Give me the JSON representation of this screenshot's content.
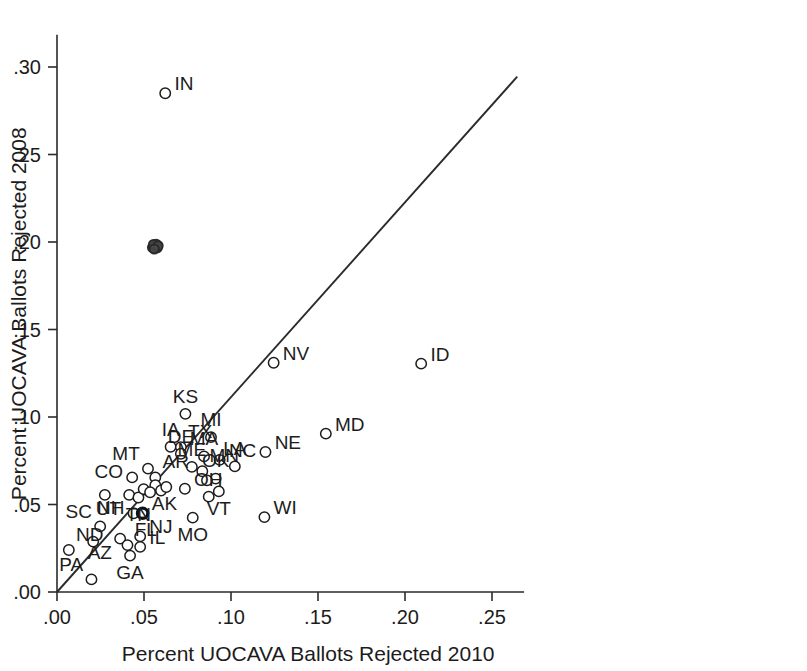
{
  "chart_data": {
    "type": "scatter",
    "title": "",
    "xlabel": "Percent UOCAVA Ballots Rejected 2010",
    "ylabel": "Percent UOCAVA Ballots Rejected 2008",
    "xlim": [
      0.0,
      0.268
    ],
    "ylim": [
      0.0,
      0.318
    ],
    "xticks": [
      0.0,
      0.05,
      0.1,
      0.15,
      0.2,
      0.25
    ],
    "yticks": [
      0.0,
      0.05,
      0.1,
      0.15,
      0.2,
      0.25,
      0.3
    ],
    "xticklabels": [
      ".00",
      ".05",
      ".10",
      ".15",
      ".20",
      ".25"
    ],
    "yticklabels": [
      ".00",
      ".05",
      ".10",
      ".15",
      ".20",
      ".25",
      ".30"
    ],
    "grid": false,
    "legend": "none",
    "reference_line": {
      "name": "45-degree-line",
      "type": "identity",
      "slope": 1.0,
      "intercept": 0.0,
      "x_start": 0.0,
      "y_start": 0.0,
      "x_end": 0.2645,
      "y_end": 0.2945
    },
    "marker_style": "open-circle",
    "points": [
      {
        "label": "IN",
        "x": 0.0622,
        "y": 0.285,
        "label_pos": "right"
      },
      {
        "label": "ID",
        "x": 0.2093,
        "y": 0.1305,
        "label_pos": "right"
      },
      {
        "label": "NV",
        "x": 0.1245,
        "y": 0.131,
        "label_pos": "right"
      },
      {
        "label": "MD",
        "x": 0.1545,
        "y": 0.0905,
        "label_pos": "right"
      },
      {
        "label": "KS",
        "x": 0.0738,
        "y": 0.1018,
        "label_pos": "above"
      },
      {
        "label": "MI",
        "x": 0.0885,
        "y": 0.0885,
        "label_pos": "above"
      },
      {
        "label": "NE",
        "x": 0.1198,
        "y": 0.08,
        "label_pos": "right"
      },
      {
        "label": "IA",
        "x": 0.0653,
        "y": 0.083,
        "label_pos": "above"
      },
      {
        "label": "TX",
        "x": 0.0712,
        "y": 0.0828,
        "label_pos": "above-right"
      },
      {
        "label": "DE",
        "x": 0.0712,
        "y": 0.079,
        "label_pos": "above"
      },
      {
        "label": "MA",
        "x": 0.0845,
        "y": 0.0775,
        "label_pos": "above"
      },
      {
        "label": "NC",
        "x": 0.0935,
        "y": 0.0755,
        "label_pos": "right"
      },
      {
        "label": "LA",
        "x": 0.1022,
        "y": 0.0718,
        "label_pos": "above"
      },
      {
        "label": "MT",
        "x": 0.0523,
        "y": 0.0705,
        "label_pos": "above-left"
      },
      {
        "label": "ME",
        "x": 0.0775,
        "y": 0.0715,
        "label_pos": "above"
      },
      {
        "label": "MN",
        "x": 0.0835,
        "y": 0.069,
        "label_pos": "above-right"
      },
      {
        "label": "OK",
        "x": 0.0912,
        "y": 0.0648,
        "label_pos": "above"
      },
      {
        "label": "CO",
        "x": 0.0432,
        "y": 0.0655,
        "label_pos": "left"
      },
      {
        "label": "AR",
        "x": 0.0565,
        "y": 0.0655,
        "label_pos": "above-right"
      },
      {
        "label": "OH",
        "x": 0.0735,
        "y": 0.059,
        "label_pos": "right"
      },
      {
        "label": "VT",
        "x": 0.093,
        "y": 0.0575,
        "label_pos": "below"
      },
      {
        "label": "UT",
        "x": 0.0415,
        "y": 0.0555,
        "label_pos": "below-left"
      },
      {
        "label": "TN",
        "x": 0.0468,
        "y": 0.054,
        "label_pos": "below"
      },
      {
        "label": "NH",
        "x": 0.044,
        "y": 0.045,
        "label_pos": "left"
      },
      {
        "label": "AK",
        "x": 0.0492,
        "y": 0.045,
        "label_pos": "right",
        "style": "bold"
      },
      {
        "label": "MO",
        "x": 0.078,
        "y": 0.0425,
        "label_pos": "below"
      },
      {
        "label": "WI",
        "x": 0.1192,
        "y": 0.0428,
        "label_pos": "right"
      },
      {
        "label": "SC",
        "x": 0.0248,
        "y": 0.0375,
        "label_pos": "above-left"
      },
      {
        "label": "ND",
        "x": 0.0068,
        "y": 0.024,
        "label_pos": "above-right"
      },
      {
        "label": "AZ",
        "x": 0.0363,
        "y": 0.0305,
        "label_pos": "below-left"
      },
      {
        "label": "FL",
        "x": 0.0405,
        "y": 0.0268,
        "label_pos": "above-right"
      },
      {
        "label": "NJ",
        "x": 0.0478,
        "y": 0.0318,
        "label_pos": "right"
      },
      {
        "label": "IL",
        "x": 0.0478,
        "y": 0.0258,
        "label_pos": "right"
      },
      {
        "label": "GA",
        "x": 0.042,
        "y": 0.0208,
        "label_pos": "below"
      },
      {
        "label": "PA",
        "x": 0.0198,
        "y": 0.0072,
        "label_pos": "above-left"
      },
      {
        "label": "",
        "x": 0.0565,
        "y": 0.061,
        "label_pos": "none"
      },
      {
        "label": "",
        "x": 0.0598,
        "y": 0.058,
        "label_pos": "none"
      },
      {
        "label": "",
        "x": 0.0628,
        "y": 0.06,
        "label_pos": "none"
      },
      {
        "label": "",
        "x": 0.0498,
        "y": 0.0588,
        "label_pos": "none"
      },
      {
        "label": "",
        "x": 0.0535,
        "y": 0.057,
        "label_pos": "none"
      },
      {
        "label": "",
        "x": 0.0862,
        "y": 0.0638,
        "label_pos": "none"
      },
      {
        "label": "",
        "x": 0.0275,
        "y": 0.0555,
        "label_pos": "none"
      },
      {
        "label": "",
        "x": 0.0872,
        "y": 0.0545,
        "label_pos": "none"
      },
      {
        "label": "",
        "x": 0.0208,
        "y": 0.0288,
        "label_pos": "none"
      }
    ],
    "overlap_cluster": {
      "name": "overplotted-marker-cluster",
      "x": 0.0563,
      "y": 0.1975,
      "note": "dark overlapping unlabeled markers"
    }
  }
}
